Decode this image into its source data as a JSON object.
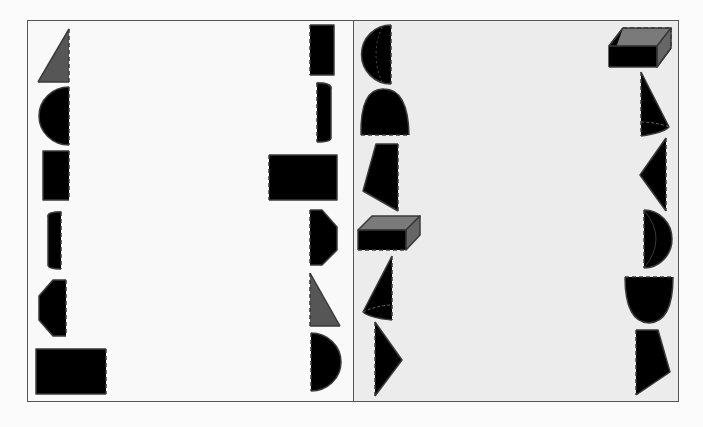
{
  "colors": {
    "light": "#a9a9a9",
    "medium": "#8e8e8e",
    "dark": "#565656",
    "stroke": "#3a3a3a",
    "left_bg": "#f9f9f9",
    "right_bg": "#ececec"
  },
  "panels": {
    "left": {
      "shapes": [
        {
          "id": "triangle-dark-left",
          "column": "left",
          "type": "right-triangle",
          "fill": "dark"
        },
        {
          "id": "semicircle-left",
          "column": "left",
          "type": "half-disk",
          "fill": "light"
        },
        {
          "id": "rectangle-small-left",
          "column": "left",
          "type": "rectangle",
          "fill": "medium"
        },
        {
          "id": "half-cylinder-left",
          "column": "left",
          "type": "half-cylinder",
          "fill": "dark"
        },
        {
          "id": "half-hexagon-left",
          "column": "left",
          "type": "half-hexagon",
          "fill": "light"
        },
        {
          "id": "rectangle-large-left",
          "column": "left",
          "type": "rectangle",
          "fill": "medium"
        },
        {
          "id": "rectangle-small-right",
          "column": "right",
          "type": "rectangle",
          "fill": "medium"
        },
        {
          "id": "half-cylinder-right",
          "column": "right",
          "type": "half-cylinder",
          "fill": "dark"
        },
        {
          "id": "rectangle-wide-right",
          "column": "right",
          "type": "rectangle",
          "fill": "medium"
        },
        {
          "id": "half-hexagon-right",
          "column": "right",
          "type": "half-hexagon",
          "fill": "light"
        },
        {
          "id": "triangle-dark-right",
          "column": "right",
          "type": "right-triangle",
          "fill": "dark"
        },
        {
          "id": "semicircle-right",
          "column": "right",
          "type": "half-disk",
          "fill": "light"
        }
      ]
    },
    "right": {
      "shapes": [
        {
          "id": "hemisphere-left",
          "column": "left",
          "type": "hemisphere",
          "fill": "medium"
        },
        {
          "id": "paraboloid-left",
          "column": "left",
          "type": "half-ellipse",
          "fill": "light"
        },
        {
          "id": "trapezoid-left",
          "column": "left",
          "type": "quadrilateral",
          "fill": "medium"
        },
        {
          "id": "prism-left",
          "column": "left",
          "type": "rectangular-prism",
          "fill": "dark"
        },
        {
          "id": "half-cone-left",
          "column": "left",
          "type": "half-cone",
          "fill": "light"
        },
        {
          "id": "triangle-left",
          "column": "left",
          "type": "triangle",
          "fill": "dark"
        },
        {
          "id": "prism-right",
          "column": "right",
          "type": "rectangular-prism",
          "fill": "dark"
        },
        {
          "id": "half-cone-right",
          "column": "right",
          "type": "half-cone",
          "fill": "light"
        },
        {
          "id": "triangle-right",
          "column": "right",
          "type": "triangle",
          "fill": "dark"
        },
        {
          "id": "hemisphere-right",
          "column": "right",
          "type": "hemisphere",
          "fill": "medium"
        },
        {
          "id": "bowl-right",
          "column": "right",
          "type": "half-ellipse",
          "fill": "light"
        },
        {
          "id": "quadrilateral-right",
          "column": "right",
          "type": "quadrilateral",
          "fill": "medium"
        }
      ]
    }
  }
}
